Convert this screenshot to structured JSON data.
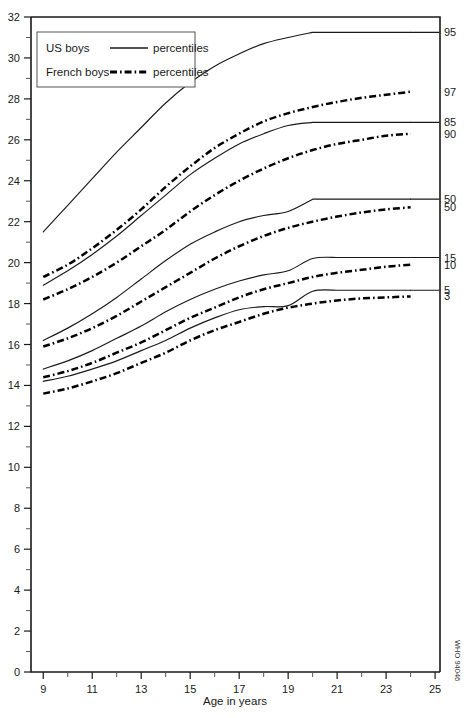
{
  "chart_data": {
    "type": "line",
    "title": "",
    "xlabel": "Age in years",
    "ylabel": "",
    "xlim": [
      8.5,
      25.2
    ],
    "ylim": [
      0,
      32
    ],
    "grid": false,
    "legend_position": "top-left",
    "x_ticks_major": [
      9,
      11,
      13,
      15,
      17,
      19,
      21,
      23,
      25
    ],
    "x_ticks_minor": [
      10,
      12,
      14,
      16,
      18,
      20,
      22,
      24
    ],
    "y_ticks_major": [
      0,
      2,
      4,
      6,
      8,
      10,
      12,
      14,
      16,
      18,
      20,
      22,
      24,
      26,
      28,
      30,
      32
    ],
    "y_ticks_minor": [
      1,
      3,
      5,
      7,
      9,
      11,
      13,
      15,
      17,
      19,
      21,
      23,
      25,
      27,
      29,
      31
    ],
    "x_tick_labels": [
      "9",
      "11",
      "13",
      "15",
      "17",
      "19",
      "21",
      "23",
      "25"
    ],
    "y_tick_labels": [
      "0",
      "2",
      "4",
      "6",
      "8",
      "10",
      "12",
      "14",
      "16",
      "18",
      "20",
      "22",
      "24",
      "26",
      "28",
      "30",
      "32"
    ],
    "series": [
      {
        "name": "US boys 95th percentile",
        "group": "US boys",
        "style": "solid",
        "end_label": "95",
        "x": [
          9,
          10,
          11,
          12,
          13,
          14,
          15,
          16,
          17,
          18,
          19,
          20,
          21,
          22,
          23,
          24
        ],
        "values": [
          21.5,
          22.8,
          24.1,
          25.4,
          26.6,
          27.8,
          28.8,
          29.6,
          30.2,
          30.7,
          31.0,
          31.25,
          31.25,
          31.25,
          31.25,
          31.25
        ]
      },
      {
        "name": "French boys 97th percentile",
        "group": "French boys",
        "style": "dash-dot",
        "end_label": "97",
        "x": [
          9,
          10,
          11,
          12,
          13,
          14,
          15,
          16,
          17,
          18,
          19,
          20,
          21,
          22,
          23,
          24
        ],
        "values": [
          19.3,
          19.9,
          20.7,
          21.6,
          22.6,
          23.7,
          24.7,
          25.6,
          26.3,
          26.9,
          27.3,
          27.6,
          27.85,
          28.05,
          28.2,
          28.35
        ]
      },
      {
        "name": "US boys 85th percentile",
        "group": "US boys",
        "style": "solid",
        "end_label": "85",
        "x": [
          9,
          10,
          11,
          12,
          13,
          14,
          15,
          16,
          17,
          18,
          19,
          20,
          21,
          22,
          23,
          24
        ],
        "values": [
          18.9,
          19.6,
          20.4,
          21.3,
          22.3,
          23.3,
          24.3,
          25.1,
          25.8,
          26.3,
          26.7,
          26.85,
          26.85,
          26.85,
          26.85,
          26.85
        ]
      },
      {
        "name": "French boys 90th percentile",
        "group": "French boys",
        "style": "dash-dot",
        "end_label": "90",
        "x": [
          9,
          10,
          11,
          12,
          13,
          14,
          15,
          16,
          17,
          18,
          19,
          20,
          21,
          22,
          23,
          24
        ],
        "values": [
          18.2,
          18.7,
          19.3,
          20.0,
          20.8,
          21.6,
          22.5,
          23.3,
          24.0,
          24.6,
          25.1,
          25.5,
          25.8,
          26.0,
          26.2,
          26.3
        ]
      },
      {
        "name": "US boys 50th percentile",
        "group": "US boys",
        "style": "solid",
        "end_label": "50",
        "x": [
          9,
          10,
          11,
          12,
          13,
          14,
          15,
          16,
          17,
          18,
          19,
          20,
          21,
          22,
          23,
          24
        ],
        "values": [
          16.2,
          16.8,
          17.5,
          18.3,
          19.2,
          20.1,
          20.9,
          21.5,
          22.0,
          22.3,
          22.5,
          23.1,
          23.1,
          23.1,
          23.1,
          23.1
        ]
      },
      {
        "name": "French boys 50th percentile",
        "group": "French boys",
        "style": "dash-dot",
        "end_label": "50",
        "x": [
          9,
          10,
          11,
          12,
          13,
          14,
          15,
          16,
          17,
          18,
          19,
          20,
          21,
          22,
          23,
          24
        ],
        "values": [
          15.9,
          16.3,
          16.8,
          17.4,
          18.1,
          18.8,
          19.5,
          20.2,
          20.8,
          21.3,
          21.7,
          22.0,
          22.25,
          22.45,
          22.6,
          22.7
        ]
      },
      {
        "name": "US boys 15th percentile",
        "group": "US boys",
        "style": "solid",
        "end_label": "15",
        "x": [
          9,
          10,
          11,
          12,
          13,
          14,
          15,
          16,
          17,
          18,
          19,
          20,
          21,
          22,
          23,
          24
        ],
        "values": [
          14.8,
          15.2,
          15.7,
          16.3,
          16.9,
          17.6,
          18.2,
          18.7,
          19.1,
          19.4,
          19.6,
          20.2,
          20.25,
          20.25,
          20.25,
          20.25
        ]
      },
      {
        "name": "French boys 10th percentile",
        "group": "French boys",
        "style": "dash-dot",
        "end_label": "10",
        "x": [
          9,
          10,
          11,
          12,
          13,
          14,
          15,
          16,
          17,
          18,
          19,
          20,
          21,
          22,
          23,
          24
        ],
        "values": [
          14.4,
          14.7,
          15.1,
          15.6,
          16.1,
          16.7,
          17.3,
          17.8,
          18.3,
          18.7,
          19.0,
          19.3,
          19.5,
          19.65,
          19.8,
          19.9
        ]
      },
      {
        "name": "US boys 5th percentile",
        "group": "US boys",
        "style": "solid",
        "end_label": "5",
        "x": [
          9,
          10,
          11,
          12,
          13,
          14,
          15,
          16,
          17,
          18,
          19,
          20,
          21,
          22,
          23,
          24
        ],
        "values": [
          14.2,
          14.45,
          14.8,
          15.2,
          15.7,
          16.2,
          16.8,
          17.3,
          17.7,
          17.85,
          17.9,
          18.6,
          18.65,
          18.65,
          18.65,
          18.65
        ]
      },
      {
        "name": "French boys 3rd percentile",
        "group": "French boys",
        "style": "dash-dot",
        "end_label": "3",
        "x": [
          9,
          10,
          11,
          12,
          13,
          14,
          15,
          16,
          17,
          18,
          19,
          20,
          21,
          22,
          23,
          24
        ],
        "values": [
          13.6,
          13.85,
          14.2,
          14.6,
          15.1,
          15.6,
          16.2,
          16.7,
          17.1,
          17.5,
          17.8,
          18.0,
          18.15,
          18.25,
          18.3,
          18.35
        ]
      }
    ]
  },
  "legend": {
    "rows": [
      {
        "label": "US boys",
        "style": "solid",
        "suffix": "percentiles"
      },
      {
        "label": "French boys",
        "style": "dash-dot",
        "suffix": "percentiles"
      }
    ]
  },
  "axis": {
    "x_title": "Age in years"
  },
  "credit": {
    "text": "WHO 94046"
  },
  "colors": {
    "line": "#1a1a1a",
    "background": "#ffffff",
    "axis": "#1a1a1a"
  }
}
